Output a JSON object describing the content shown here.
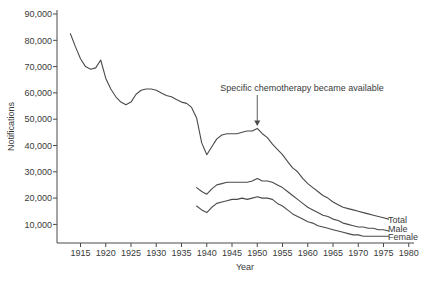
{
  "figure_colors": {
    "line": "#4a4a4a",
    "text": "#3a3a3a",
    "background": "#ffffff"
  },
  "chart_data": {
    "type": "line",
    "title": "",
    "xlabel": "Year",
    "ylabel": "Notifications",
    "grid": false,
    "legend_position": "end-of-line-labels",
    "x_ticks": [
      1915,
      1920,
      1925,
      1930,
      1935,
      1940,
      1945,
      1950,
      1955,
      1960,
      1965,
      1970,
      1975,
      1980
    ],
    "y_ticks": [
      10000,
      20000,
      30000,
      40000,
      50000,
      60000,
      70000,
      80000,
      90000
    ],
    "xlim": [
      1910.3,
      1981.5
    ],
    "ylim": [
      3000,
      91500
    ],
    "annotation": {
      "text": "Specific chemotherapy became available",
      "year": 1950,
      "value": 46500
    },
    "series": [
      {
        "name": "Total",
        "points": [
          [
            1913,
            82500
          ],
          [
            1914,
            77500
          ],
          [
            1915,
            73000
          ],
          [
            1916,
            70000
          ],
          [
            1917,
            69000
          ],
          [
            1918,
            69500
          ],
          [
            1919,
            72500
          ],
          [
            1920,
            65500
          ],
          [
            1921,
            61500
          ],
          [
            1922,
            58500
          ],
          [
            1923,
            56500
          ],
          [
            1924,
            55500
          ],
          [
            1925,
            56500
          ],
          [
            1926,
            59500
          ],
          [
            1927,
            61000
          ],
          [
            1928,
            61500
          ],
          [
            1929,
            61500
          ],
          [
            1930,
            61000
          ],
          [
            1931,
            60000
          ],
          [
            1932,
            59000
          ],
          [
            1933,
            58500
          ],
          [
            1934,
            57500
          ],
          [
            1935,
            56500
          ],
          [
            1936,
            56000
          ],
          [
            1937,
            54500
          ],
          [
            1938,
            50500
          ],
          [
            1939,
            41000
          ],
          [
            1940,
            36500
          ],
          [
            1941,
            39500
          ],
          [
            1942,
            42500
          ],
          [
            1943,
            44000
          ],
          [
            1944,
            44500
          ],
          [
            1945,
            44500
          ],
          [
            1946,
            44500
          ],
          [
            1947,
            45000
          ],
          [
            1948,
            45500
          ],
          [
            1949,
            45500
          ],
          [
            1950,
            46500
          ],
          [
            1951,
            44500
          ],
          [
            1952,
            43000
          ],
          [
            1953,
            40500
          ],
          [
            1954,
            38500
          ],
          [
            1955,
            36500
          ],
          [
            1956,
            34000
          ],
          [
            1957,
            31500
          ],
          [
            1958,
            30000
          ],
          [
            1959,
            27500
          ],
          [
            1960,
            25500
          ],
          [
            1961,
            24000
          ],
          [
            1962,
            22500
          ],
          [
            1963,
            21000
          ],
          [
            1964,
            20000
          ],
          [
            1965,
            18500
          ],
          [
            1966,
            17500
          ],
          [
            1967,
            16500
          ],
          [
            1968,
            16000
          ],
          [
            1969,
            15500
          ],
          [
            1970,
            15000
          ],
          [
            1971,
            14500
          ],
          [
            1972,
            14000
          ],
          [
            1973,
            13500
          ],
          [
            1974,
            13000
          ],
          [
            1975,
            12500
          ],
          [
            1976,
            12000
          ]
        ]
      },
      {
        "name": "Male",
        "points": [
          [
            1938,
            24000
          ],
          [
            1939,
            22500
          ],
          [
            1940,
            21500
          ],
          [
            1941,
            23500
          ],
          [
            1942,
            25000
          ],
          [
            1943,
            25500
          ],
          [
            1944,
            26000
          ],
          [
            1945,
            26000
          ],
          [
            1946,
            26000
          ],
          [
            1947,
            26000
          ],
          [
            1948,
            26000
          ],
          [
            1949,
            26500
          ],
          [
            1950,
            27500
          ],
          [
            1951,
            26500
          ],
          [
            1952,
            26500
          ],
          [
            1953,
            26000
          ],
          [
            1954,
            25000
          ],
          [
            1955,
            24000
          ],
          [
            1956,
            22500
          ],
          [
            1957,
            21000
          ],
          [
            1958,
            19500
          ],
          [
            1959,
            18000
          ],
          [
            1960,
            16500
          ],
          [
            1961,
            15500
          ],
          [
            1962,
            14500
          ],
          [
            1963,
            13500
          ],
          [
            1964,
            13000
          ],
          [
            1965,
            12000
          ],
          [
            1966,
            11500
          ],
          [
            1967,
            10500
          ],
          [
            1968,
            10000
          ],
          [
            1969,
            9500
          ],
          [
            1970,
            9000
          ],
          [
            1971,
            9000
          ],
          [
            1972,
            8500
          ],
          [
            1973,
            8500
          ],
          [
            1974,
            8000
          ],
          [
            1975,
            8000
          ],
          [
            1976,
            7500
          ]
        ]
      },
      {
        "name": "Female",
        "points": [
          [
            1938,
            17000
          ],
          [
            1939,
            15500
          ],
          [
            1940,
            14500
          ],
          [
            1941,
            16500
          ],
          [
            1942,
            18000
          ],
          [
            1943,
            18500
          ],
          [
            1944,
            19000
          ],
          [
            1945,
            19500
          ],
          [
            1946,
            19500
          ],
          [
            1947,
            20000
          ],
          [
            1948,
            19500
          ],
          [
            1949,
            20000
          ],
          [
            1950,
            20500
          ],
          [
            1951,
            20000
          ],
          [
            1952,
            20000
          ],
          [
            1953,
            19500
          ],
          [
            1954,
            18000
          ],
          [
            1955,
            17000
          ],
          [
            1956,
            15500
          ],
          [
            1957,
            14000
          ],
          [
            1958,
            13000
          ],
          [
            1959,
            12000
          ],
          [
            1960,
            11000
          ],
          [
            1961,
            10500
          ],
          [
            1962,
            9500
          ],
          [
            1963,
            9000
          ],
          [
            1964,
            8500
          ],
          [
            1965,
            8000
          ],
          [
            1966,
            7500
          ],
          [
            1967,
            7000
          ],
          [
            1968,
            6500
          ],
          [
            1969,
            6000
          ],
          [
            1970,
            6000
          ],
          [
            1971,
            5500
          ],
          [
            1972,
            5500
          ],
          [
            1973,
            5500
          ],
          [
            1974,
            5500
          ],
          [
            1975,
            5500
          ],
          [
            1976,
            5500
          ]
        ]
      }
    ]
  }
}
